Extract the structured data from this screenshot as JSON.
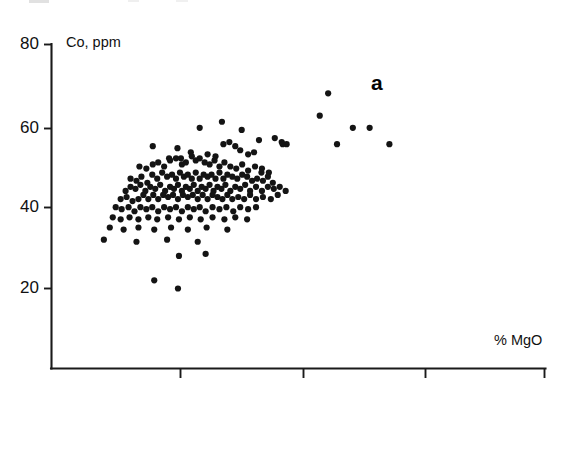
{
  "figure": {
    "panel_label": "a",
    "background_color": "#ffffff",
    "ink_color": "#141414"
  },
  "chart_data": {
    "type": "scatter",
    "title": "",
    "subtitle": "",
    "panel_label": "a",
    "xlabel": "% MgO",
    "ylabel": "Co, ppm",
    "ylabel_position": "top-left-inside",
    "xlabel_position": "bottom-right-above-axis",
    "grid": false,
    "legend": null,
    "ylim": [
      0,
      80
    ],
    "yticks": [
      20,
      40,
      60,
      80
    ],
    "ytick_labels": [
      "20",
      "40",
      "60",
      "80"
    ],
    "xlim": [
      0,
      1
    ],
    "xticks_unlabeled_count": 3,
    "xtick_labels": [],
    "marker": "filled-circle",
    "marker_color": "#141414",
    "marker_size_px": 3.1,
    "n_points": 196,
    "points": [
      [
        0.255,
        54.5
      ],
      [
        0.3,
        59.5
      ],
      [
        0.345,
        61.0
      ],
      [
        0.385,
        59.0
      ],
      [
        0.42,
        56.5
      ],
      [
        0.452,
        57.0
      ],
      [
        0.466,
        56.0
      ],
      [
        0.476,
        55.5
      ],
      [
        0.205,
        55.0
      ],
      [
        0.238,
        52.0
      ],
      [
        0.262,
        52.0
      ],
      [
        0.282,
        53.5
      ],
      [
        0.316,
        53.0
      ],
      [
        0.332,
        52.5
      ],
      [
        0.348,
        55.5
      ],
      [
        0.36,
        56.0
      ],
      [
        0.372,
        55.0
      ],
      [
        0.382,
        54.0
      ],
      [
        0.398,
        53.0
      ],
      [
        0.41,
        53.5
      ],
      [
        0.178,
        50.0
      ],
      [
        0.192,
        49.5
      ],
      [
        0.205,
        50.5
      ],
      [
        0.216,
        51.0
      ],
      [
        0.228,
        50.0
      ],
      [
        0.24,
        51.5
      ],
      [
        0.252,
        52.0
      ],
      [
        0.264,
        50.5
      ],
      [
        0.272,
        51.0
      ],
      [
        0.284,
        52.5
      ],
      [
        0.292,
        51.5
      ],
      [
        0.3,
        52.0
      ],
      [
        0.31,
        51.0
      ],
      [
        0.32,
        50.5
      ],
      [
        0.33,
        51.5
      ],
      [
        0.34,
        50.0
      ],
      [
        0.35,
        51.0
      ],
      [
        0.362,
        50.0
      ],
      [
        0.374,
        49.5
      ],
      [
        0.386,
        50.5
      ],
      [
        0.398,
        49.0
      ],
      [
        0.412,
        50.0
      ],
      [
        0.426,
        49.5
      ],
      [
        0.44,
        48.5
      ],
      [
        0.16,
        47.0
      ],
      [
        0.172,
        46.5
      ],
      [
        0.182,
        47.5
      ],
      [
        0.194,
        46.0
      ],
      [
        0.204,
        48.0
      ],
      [
        0.214,
        47.0
      ],
      [
        0.224,
        48.5
      ],
      [
        0.234,
        47.5
      ],
      [
        0.244,
        48.0
      ],
      [
        0.252,
        47.0
      ],
      [
        0.26,
        48.5
      ],
      [
        0.268,
        47.5
      ],
      [
        0.276,
        48.0
      ],
      [
        0.284,
        47.0
      ],
      [
        0.292,
        48.5
      ],
      [
        0.3,
        47.0
      ],
      [
        0.308,
        48.0
      ],
      [
        0.316,
        47.5
      ],
      [
        0.324,
        48.0
      ],
      [
        0.332,
        47.0
      ],
      [
        0.34,
        48.5
      ],
      [
        0.348,
        47.0
      ],
      [
        0.356,
        48.0
      ],
      [
        0.366,
        47.5
      ],
      [
        0.376,
        47.0
      ],
      [
        0.386,
        48.0
      ],
      [
        0.396,
        47.5
      ],
      [
        0.406,
        46.5
      ],
      [
        0.416,
        47.0
      ],
      [
        0.428,
        46.5
      ],
      [
        0.438,
        47.5
      ],
      [
        0.448,
        46.0
      ],
      [
        0.15,
        44.0
      ],
      [
        0.16,
        45.0
      ],
      [
        0.17,
        44.5
      ],
      [
        0.18,
        45.5
      ],
      [
        0.19,
        44.0
      ],
      [
        0.2,
        45.0
      ],
      [
        0.21,
        44.5
      ],
      [
        0.22,
        45.5
      ],
      [
        0.23,
        44.0
      ],
      [
        0.24,
        45.0
      ],
      [
        0.248,
        44.5
      ],
      [
        0.256,
        45.5
      ],
      [
        0.264,
        44.0
      ],
      [
        0.272,
        45.0
      ],
      [
        0.28,
        44.5
      ],
      [
        0.288,
        45.5
      ],
      [
        0.296,
        44.0
      ],
      [
        0.304,
        45.0
      ],
      [
        0.312,
        44.5
      ],
      [
        0.32,
        45.5
      ],
      [
        0.328,
        44.0
      ],
      [
        0.336,
        45.0
      ],
      [
        0.344,
        44.5
      ],
      [
        0.352,
        45.5
      ],
      [
        0.362,
        44.0
      ],
      [
        0.372,
        45.0
      ],
      [
        0.382,
        44.5
      ],
      [
        0.392,
        45.5
      ],
      [
        0.402,
        44.0
      ],
      [
        0.414,
        45.0
      ],
      [
        0.426,
        44.0
      ],
      [
        0.438,
        45.0
      ],
      [
        0.45,
        44.5
      ],
      [
        0.462,
        45.0
      ],
      [
        0.474,
        44.0
      ],
      [
        0.14,
        42.0
      ],
      [
        0.152,
        42.5
      ],
      [
        0.164,
        41.5
      ],
      [
        0.176,
        42.0
      ],
      [
        0.186,
        43.0
      ],
      [
        0.196,
        42.0
      ],
      [
        0.206,
        43.0
      ],
      [
        0.216,
        42.0
      ],
      [
        0.226,
        43.0
      ],
      [
        0.236,
        42.5
      ],
      [
        0.246,
        43.0
      ],
      [
        0.256,
        42.0
      ],
      [
        0.266,
        43.0
      ],
      [
        0.276,
        42.5
      ],
      [
        0.286,
        43.0
      ],
      [
        0.296,
        42.0
      ],
      [
        0.306,
        43.0
      ],
      [
        0.316,
        42.0
      ],
      [
        0.326,
        43.0
      ],
      [
        0.336,
        42.5
      ],
      [
        0.346,
        42.0
      ],
      [
        0.356,
        43.0
      ],
      [
        0.366,
        42.0
      ],
      [
        0.378,
        42.5
      ],
      [
        0.39,
        42.0
      ],
      [
        0.402,
        43.0
      ],
      [
        0.414,
        42.0
      ],
      [
        0.428,
        42.5
      ],
      [
        0.444,
        42.0
      ],
      [
        0.458,
        43.0
      ],
      [
        0.13,
        40.0
      ],
      [
        0.142,
        39.5
      ],
      [
        0.156,
        40.0
      ],
      [
        0.168,
        39.0
      ],
      [
        0.18,
        40.0
      ],
      [
        0.192,
        39.5
      ],
      [
        0.204,
        40.0
      ],
      [
        0.216,
        39.0
      ],
      [
        0.228,
        40.0
      ],
      [
        0.24,
        39.5
      ],
      [
        0.252,
        40.0
      ],
      [
        0.264,
        39.0
      ],
      [
        0.276,
        40.0
      ],
      [
        0.288,
        39.5
      ],
      [
        0.3,
        40.0
      ],
      [
        0.312,
        39.0
      ],
      [
        0.326,
        40.0
      ],
      [
        0.34,
        39.5
      ],
      [
        0.354,
        40.0
      ],
      [
        0.368,
        39.0
      ],
      [
        0.382,
        40.0
      ],
      [
        0.398,
        39.5
      ],
      [
        0.414,
        40.0
      ],
      [
        0.124,
        37.5
      ],
      [
        0.14,
        37.0
      ],
      [
        0.158,
        37.5
      ],
      [
        0.176,
        37.0
      ],
      [
        0.196,
        37.5
      ],
      [
        0.214,
        37.0
      ],
      [
        0.236,
        37.5
      ],
      [
        0.258,
        37.0
      ],
      [
        0.28,
        37.5
      ],
      [
        0.302,
        37.0
      ],
      [
        0.326,
        37.5
      ],
      [
        0.35,
        37.0
      ],
      [
        0.372,
        37.5
      ],
      [
        0.396,
        37.0
      ],
      [
        0.118,
        35.0
      ],
      [
        0.146,
        34.5
      ],
      [
        0.176,
        35.0
      ],
      [
        0.208,
        34.5
      ],
      [
        0.242,
        35.0
      ],
      [
        0.276,
        34.5
      ],
      [
        0.314,
        35.0
      ],
      [
        0.356,
        34.5
      ],
      [
        0.106,
        32.0
      ],
      [
        0.172,
        31.5
      ],
      [
        0.234,
        32.0
      ],
      [
        0.296,
        31.5
      ],
      [
        0.258,
        28.0
      ],
      [
        0.312,
        28.5
      ],
      [
        0.208,
        22.0
      ],
      [
        0.256,
        20.0
      ],
      [
        0.56,
        68.0
      ],
      [
        0.543,
        62.5
      ],
      [
        0.61,
        59.5
      ],
      [
        0.644,
        59.5
      ],
      [
        0.578,
        55.5
      ],
      [
        0.684,
        55.5
      ],
      [
        0.468,
        55.5
      ],
      [
        0.425,
        48.5
      ]
    ]
  },
  "axes": {
    "y_axis_title": "Co, ppm",
    "x_axis_title": "% MgO",
    "y_tick_labels": [
      "80",
      "60",
      "40",
      "20"
    ],
    "x_tick_count": 3
  }
}
